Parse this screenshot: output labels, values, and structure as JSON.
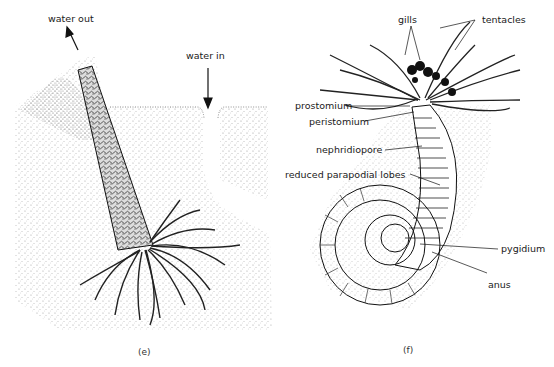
{
  "panel_e": {
    "caption": "(e)",
    "labels": {
      "water_out": "water out",
      "water_in": "water in"
    }
  },
  "panel_f": {
    "caption": "(f)",
    "labels": {
      "gills": "gills",
      "tentacles": "tentacles",
      "prostomium": "prostomium",
      "peristomium": "peristomium",
      "nephridiopore": "nephridiopore",
      "reduced_parapodial_lobes": "reduced parapodial lobes",
      "pygidium": "pygidium",
      "anus": "anus"
    }
  }
}
